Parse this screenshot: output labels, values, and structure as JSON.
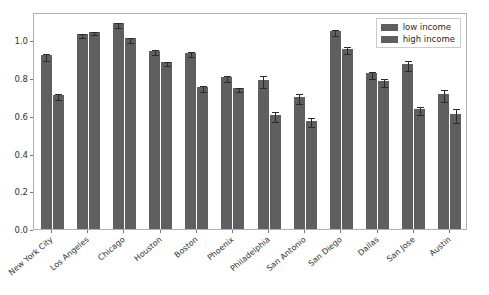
{
  "chart_data": {
    "type": "bar",
    "title": "",
    "xlabel": "",
    "ylabel": "",
    "grid": false,
    "legend_position": "upper right",
    "ylim": [
      0.0,
      1.15
    ],
    "yticks": [
      "0.0",
      "0.2",
      "0.4",
      "0.6",
      "0.8",
      "1.0"
    ],
    "ytick_values": [
      0.0,
      0.2,
      0.4,
      0.6,
      0.8,
      1.0
    ],
    "categories": [
      "New York City",
      "Los Angeles",
      "Chicago",
      "Houston",
      "Boston",
      "Phoenix",
      "Philadelphia",
      "San Antonio",
      "San Diego",
      "Dallas",
      "San Jose",
      "Austin"
    ],
    "series": [
      {
        "name": "low income",
        "color": "#5f5f5f",
        "values": [
          0.92,
          1.035,
          1.09,
          0.945,
          0.935,
          0.805,
          0.79,
          0.7,
          1.05,
          0.825,
          0.875,
          0.715
        ],
        "errors": [
          0.018,
          0.01,
          0.014,
          0.014,
          0.014,
          0.015,
          0.03,
          0.025,
          0.014,
          0.018,
          0.028,
          0.032
        ]
      },
      {
        "name": "high income",
        "color": "#5f5f5f",
        "values": [
          0.71,
          1.045,
          1.01,
          0.885,
          0.755,
          0.748,
          0.605,
          0.575,
          0.955,
          0.785,
          0.635,
          0.61
        ],
        "errors": [
          0.015,
          0.008,
          0.014,
          0.01,
          0.016,
          0.01,
          0.025,
          0.022,
          0.018,
          0.02,
          0.022,
          0.038
        ]
      }
    ]
  },
  "legend": {
    "entries": [
      {
        "label": "low income"
      },
      {
        "label": "high income"
      }
    ]
  }
}
